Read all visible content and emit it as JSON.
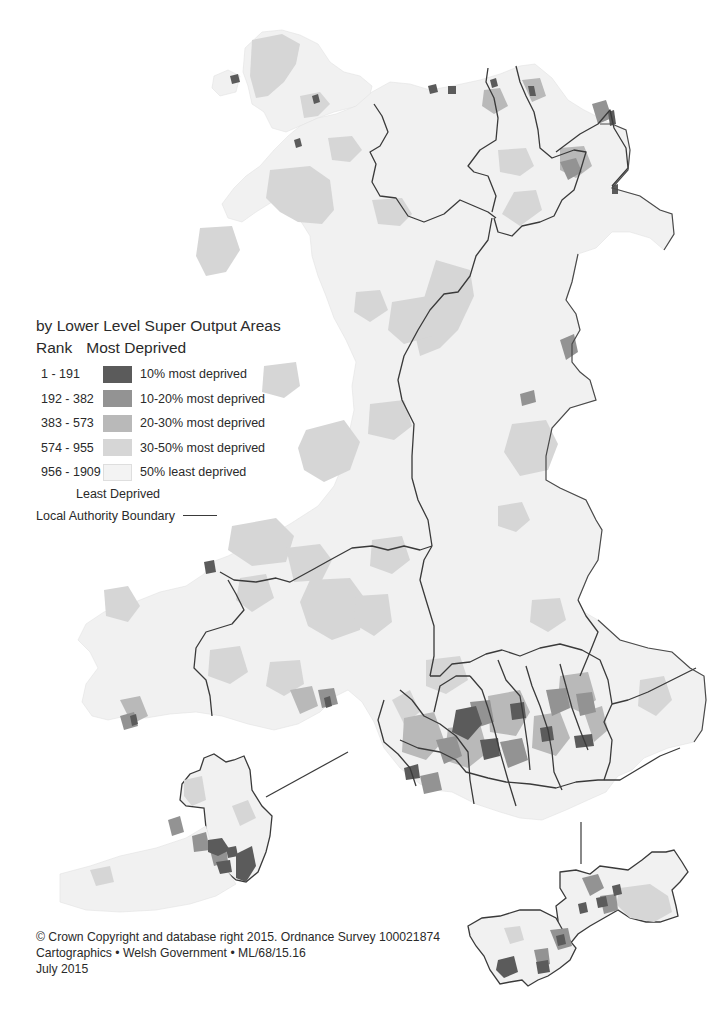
{
  "legend": {
    "title": "by Lower Level Super Output Areas",
    "rank_label": "Rank",
    "most_deprived_label": "Most Deprived",
    "least_deprived_label": "Least Deprived",
    "classes": [
      {
        "range": "1 - 191",
        "label": "10% most deprived",
        "color": "#5b5b5b"
      },
      {
        "range": "192 - 382",
        "label": "10-20% most deprived",
        "color": "#8f8f8f"
      },
      {
        "range": "383 - 573",
        "label": "20-30% most deprived",
        "color": "#b4b4b4"
      },
      {
        "range": "574 - 955",
        "label": "30-50% most deprived",
        "color": "#d6d6d6"
      },
      {
        "range": "956 - 1909",
        "label": "50% least deprived",
        "color": "#f1f1f1"
      }
    ],
    "boundary_label": "Local Authority Boundary",
    "boundary_color": "#3a3a3a"
  },
  "credits": {
    "line1": "© Crown Copyright and database right 2015. Ordnance Survey 100021874",
    "line2": "Cartographics • Welsh Government • ML/68/15.16",
    "line3": "July 2015"
  },
  "map": {
    "subject": "Wales",
    "insets": [
      "Swansea area inset",
      "Cardiff and Newport inset"
    ]
  }
}
